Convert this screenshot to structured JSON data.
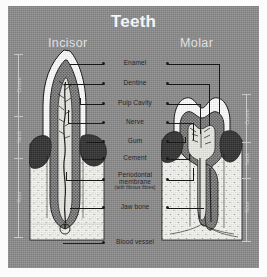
{
  "diagram": {
    "title": "Teeth",
    "subheadings": {
      "left": "Incisor",
      "right": "Molar"
    },
    "background_color": "#8c8c8c",
    "text_color": "#111111",
    "title_color": "#ffffff"
  },
  "region_scale": {
    "left": [
      "Crown",
      "Neck",
      "Root"
    ],
    "right": [
      "Crown",
      "Neck",
      "Root"
    ]
  },
  "labels": [
    {
      "id": "enamel",
      "text": "Enamel",
      "sub": ""
    },
    {
      "id": "dentine",
      "text": "Dentine",
      "sub": ""
    },
    {
      "id": "pulp-cavity",
      "text": "Pulp Cavity",
      "sub": ""
    },
    {
      "id": "nerve",
      "text": "Nerve",
      "sub": ""
    },
    {
      "id": "gum",
      "text": "Gum",
      "sub": ""
    },
    {
      "id": "cement",
      "text": "Cement",
      "sub": ""
    },
    {
      "id": "periodontal-membrane",
      "text": "Periodontal membrane",
      "sub": "(with fibrous fibres)"
    },
    {
      "id": "jaw-bone",
      "text": "Jaw bone",
      "sub": ""
    },
    {
      "id": "blood-vessel",
      "text": "Blood vessel",
      "sub": ""
    }
  ],
  "colors": {
    "enamel": "#fdfdfd",
    "dentine": "#6f6f6f",
    "pulp": "#cfcfcf",
    "gum": "#3a3a3a",
    "bone": "#f2f2f2",
    "outline": "#111111"
  }
}
